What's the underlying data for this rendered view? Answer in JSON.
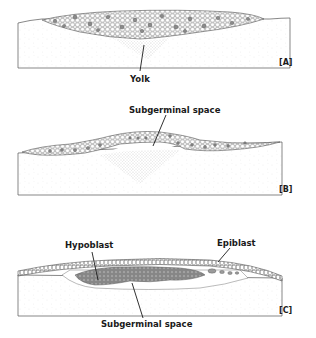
{
  "figure": {
    "panels": [
      {
        "id": "A",
        "panel_label": "[A]",
        "labels": {
          "yolk": "Yolk"
        }
      },
      {
        "id": "B",
        "panel_label": "[B]",
        "labels": {
          "subgerminal_space": "Subgerminal space"
        }
      },
      {
        "id": "C",
        "panel_label": "[C]",
        "labels": {
          "hypoblast": "Hypoblast",
          "epiblast": "Epiblast",
          "subgerminal_space": "Subgerminal space"
        }
      }
    ]
  },
  "colors": {
    "ink": "#1a1a1a",
    "cell_outline": "#555555",
    "dark_cell": "#8a8a8a",
    "yolk_stipple": "#9a9a9a"
  }
}
